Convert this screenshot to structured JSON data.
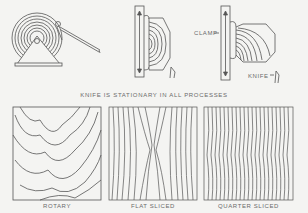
{
  "diagram": {
    "caption": "KNIFE IS STATIONARY IN ALL PROCESSES",
    "processes": [
      {
        "id": "rotary",
        "label": "ROTARY"
      },
      {
        "id": "flat-sliced",
        "label": "FLAT SLICED"
      },
      {
        "id": "quarter-sliced",
        "label": "QUARTER SLICED"
      }
    ],
    "callouts": {
      "clamp": "CLAMP",
      "knife": "KNIFE"
    },
    "colors": {
      "background": "#f4f4f2",
      "line": "#555555",
      "text": "#6a6a6a"
    }
  }
}
